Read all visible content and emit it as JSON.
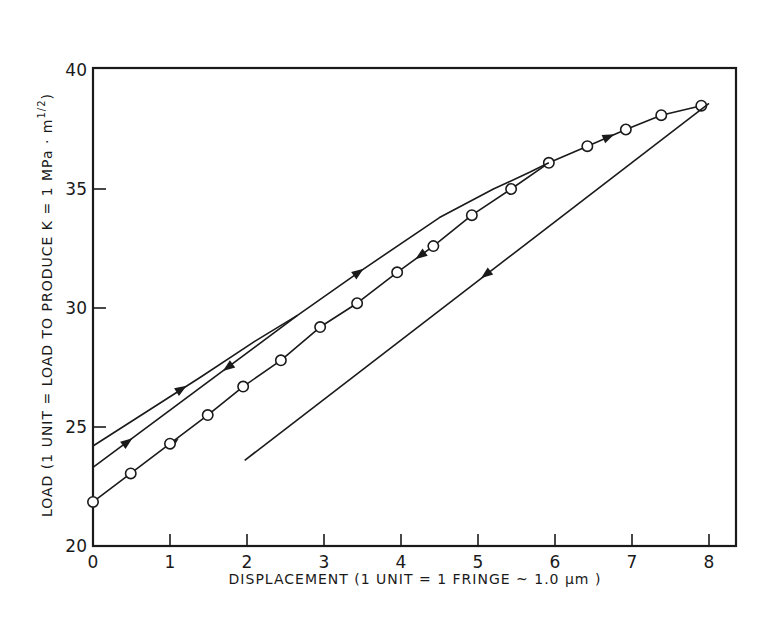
{
  "chart_data": {
    "type": "line",
    "title": "",
    "xlabel": "DISPLACEMENT (1 UNIT = 1 FRINGE ~ 1.0 μm )",
    "ylabel": "LOAD (1 UNIT = LOAD TO PRODUCE K = 1 MPa · m¹⁄₂)",
    "xlim": [
      0,
      8.4
    ],
    "ylim": [
      20,
      40
    ],
    "x_ticks": [
      0,
      1,
      2,
      3,
      4,
      5,
      6,
      7,
      8
    ],
    "y_ticks": [
      20,
      25,
      30,
      35,
      40
    ],
    "x_tick_labels": [
      "0",
      "1",
      "2",
      "3",
      "4",
      "5",
      "6",
      "7",
      "8"
    ],
    "y_tick_labels": [
      "20",
      "25",
      "30",
      "35",
      "40"
    ],
    "grid": false,
    "legend": null,
    "series": [
      {
        "name": "load-unload cycle with circle data points",
        "marker": "open-circle",
        "x": [
          0.0,
          0.49,
          1.0,
          1.49,
          1.95,
          2.44,
          2.95,
          3.43,
          3.95,
          4.42,
          4.92,
          5.43,
          5.92,
          6.42,
          6.92,
          7.38,
          7.9
        ],
        "y": [
          21.85,
          23.05,
          24.3,
          25.5,
          26.7,
          27.8,
          29.2,
          30.2,
          31.5,
          32.6,
          33.9,
          35.0,
          36.1,
          36.8,
          37.5,
          38.1,
          38.5
        ],
        "arrows": [
          {
            "x": 1.05,
            "y": 24.35,
            "dir": "up"
          },
          {
            "x": 4.25,
            "y": 32.2,
            "dir": "down"
          },
          {
            "x": 6.7,
            "y": 37.2,
            "dir": "up"
          }
        ]
      },
      {
        "name": "upper loading curve",
        "marker": "none",
        "x": [
          0.0,
          0.7,
          1.4,
          2.1,
          2.66,
          3.45,
          4.5,
          5.2,
          5.67,
          5.92
        ],
        "y": [
          24.2,
          25.65,
          27.1,
          28.6,
          29.7,
          31.5,
          33.8,
          35.0,
          35.7,
          36.1
        ],
        "arrows": [
          {
            "x": 1.15,
            "y": 26.6,
            "dir": "up"
          },
          {
            "x": 3.45,
            "y": 31.5,
            "dir": "up"
          }
        ]
      },
      {
        "name": "middle straight line",
        "marker": "none",
        "x": [
          0.0,
          2.66
        ],
        "y": [
          23.3,
          29.7
        ],
        "arrows": [
          {
            "x": 0.45,
            "y": 24.38,
            "dir": "up"
          },
          {
            "x": 1.75,
            "y": 27.5,
            "dir": "down"
          }
        ]
      },
      {
        "name": "lower unloading line",
        "marker": "none",
        "x": [
          1.97,
          8.0
        ],
        "y": [
          23.6,
          38.6
        ],
        "arrows": [
          {
            "x": 5.1,
            "y": 31.4,
            "dir": "down"
          }
        ]
      }
    ]
  },
  "axes": {
    "x_label": "DISPLACEMENT (1 UNIT = 1 FRINGE ~ 1.0 μm )",
    "y_label": "LOAD (1 UNIT = LOAD TO PRODUCE K = 1 MPa · m",
    "y_label_exponent": "1/2",
    "y_label_close": ")"
  },
  "colors": {
    "ink": "#1a1a1a",
    "background": "#ffffff"
  }
}
